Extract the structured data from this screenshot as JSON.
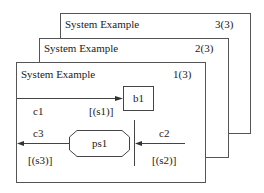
{
  "frames": [
    {
      "title": "System Example",
      "page": "3(3)"
    },
    {
      "title": "System Example",
      "page": "2(3)"
    },
    {
      "title": "System Example",
      "page": "1(3)"
    }
  ],
  "block": {
    "label": "b1"
  },
  "process": {
    "label": "ps1"
  },
  "channels": [
    {
      "name": "c1",
      "signals": "[(s1)]"
    },
    {
      "name": "c2",
      "signals": "[(s2)]"
    },
    {
      "name": "c3",
      "signals": "[(s3)]"
    }
  ]
}
